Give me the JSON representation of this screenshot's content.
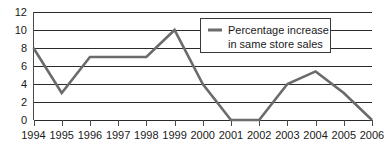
{
  "chart_data": {
    "type": "line",
    "title": "",
    "xlabel": "",
    "ylabel": "",
    "x": [
      "1994",
      "1995",
      "1996",
      "1997",
      "1998",
      "1999",
      "2000",
      "2001",
      "2002",
      "2003",
      "2004",
      "2005",
      "2006"
    ],
    "series": [
      {
        "name": "Percentage increase in same store sales",
        "values": [
          8,
          3,
          7,
          7,
          7,
          10,
          4,
          0,
          0,
          4,
          5.4,
          3,
          0
        ],
        "color": "#6b6b6b"
      }
    ],
    "ylim": [
      0,
      12
    ],
    "yticks": [
      0,
      2,
      4,
      6,
      8,
      10,
      12
    ],
    "ytick_labels": [
      "0",
      "2",
      "4",
      "6",
      "8",
      "10",
      "12"
    ],
    "xtick_labels": [
      "1994",
      "1995",
      "1996",
      "1997",
      "1998",
      "1999",
      "2000",
      "2001",
      "2002",
      "2003",
      "2004",
      "2005",
      "2006"
    ],
    "grid": true,
    "grid_axis": "y",
    "legend_position": "top-right",
    "legend_entries": [
      {
        "line1": "Percentage increase",
        "line2": "in same store sales",
        "color": "#6b6b6b"
      }
    ]
  },
  "colors": {
    "line": "#6b6b6b",
    "grid": "#2b2b2b",
    "axis": "#4a4a4a",
    "text": "#1a1a1a",
    "background": "#ffffff"
  }
}
